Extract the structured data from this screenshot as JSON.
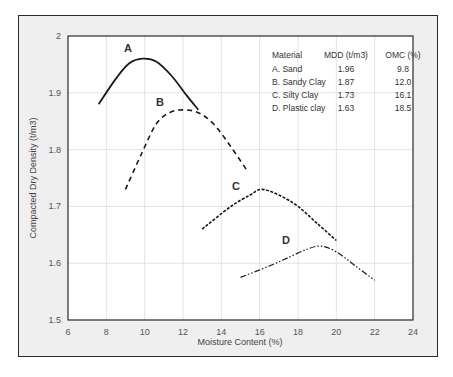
{
  "chart_data": {
    "type": "line",
    "title": "",
    "xlabel": "Moisture Content (%)",
    "ylabel": "Compacted Dry Density (t/m3)",
    "xlim": [
      6,
      24
    ],
    "ylim": [
      1.5,
      2.0
    ],
    "x_ticks": [
      "6",
      "8",
      "10",
      "12",
      "14",
      "16",
      "18",
      "20",
      "22",
      "24"
    ],
    "y_ticks": [
      "1.5",
      "1.6",
      "1.7",
      "1.8",
      "1.9",
      "2"
    ],
    "grid": true,
    "legend_position": "none (inline labels)",
    "series": [
      {
        "name": "A",
        "style": "solid",
        "points": [
          [
            7.6,
            1.88
          ],
          [
            8.5,
            1.925
          ],
          [
            9.2,
            1.952
          ],
          [
            9.9,
            1.96
          ],
          [
            10.6,
            1.955
          ],
          [
            11.4,
            1.93
          ],
          [
            12.2,
            1.895
          ],
          [
            12.8,
            1.87
          ]
        ]
      },
      {
        "name": "B",
        "style": "dashed",
        "points": [
          [
            9.0,
            1.73
          ],
          [
            9.8,
            1.79
          ],
          [
            10.6,
            1.845
          ],
          [
            11.3,
            1.865
          ],
          [
            12.0,
            1.87
          ],
          [
            12.8,
            1.865
          ],
          [
            13.6,
            1.845
          ],
          [
            14.5,
            1.805
          ],
          [
            15.4,
            1.76
          ]
        ]
      },
      {
        "name": "C",
        "style": "dotted-dense",
        "points": [
          [
            13.0,
            1.66
          ],
          [
            14.5,
            1.7
          ],
          [
            15.5,
            1.72
          ],
          [
            16.1,
            1.73
          ],
          [
            17.0,
            1.72
          ],
          [
            18.0,
            1.7
          ],
          [
            19.0,
            1.67
          ],
          [
            20.0,
            1.64
          ]
        ]
      },
      {
        "name": "D",
        "style": "dash-dot-dot",
        "points": [
          [
            15.0,
            1.575
          ],
          [
            16.5,
            1.595
          ],
          [
            17.5,
            1.61
          ],
          [
            18.5,
            1.625
          ],
          [
            19.2,
            1.63
          ],
          [
            20.0,
            1.62
          ],
          [
            21.0,
            1.595
          ],
          [
            22.0,
            1.57
          ]
        ]
      }
    ],
    "table": {
      "headers": [
        "Material",
        "MDD (t/m3)",
        "OMC (%)"
      ],
      "rows": [
        [
          "A. Sand",
          "1.96",
          "9.8"
        ],
        [
          "B. Sandy Clay",
          "1.87",
          "12.0"
        ],
        [
          "C. Silty Clay",
          "1.73",
          "16.1"
        ],
        [
          "D. Plastic clay",
          "1.63",
          "18.5"
        ]
      ]
    }
  },
  "labels": {
    "A": "A",
    "B": "B",
    "C": "C",
    "D": "D"
  }
}
